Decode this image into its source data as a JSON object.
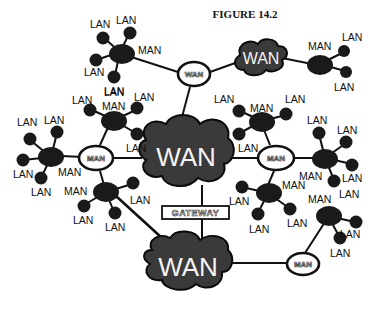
{
  "figure": {
    "title": "FIGURE 14.2"
  },
  "legend_terms": {
    "lan": "LAN",
    "man": "MAN",
    "wan": "WAN",
    "gateway": "GATEWAY"
  },
  "wan_clouds": [
    {
      "id": "wan-top-right",
      "label": "WAN"
    },
    {
      "id": "wan-center",
      "label": "WAN"
    },
    {
      "id": "wan-bottom",
      "label": "WAN"
    }
  ],
  "man_rings": [
    {
      "id": "ring-top",
      "label": "WAN"
    },
    {
      "id": "ring-left",
      "label": "MAN"
    },
    {
      "id": "ring-right",
      "label": "MAN"
    },
    {
      "id": "ring-bottom-right",
      "label": "MAN"
    }
  ],
  "gateway": {
    "label": "GATEWAY"
  },
  "man_clusters": [
    {
      "id": "cluster-top-left",
      "man_label": "MAN",
      "lan_labels": [
        "LAN",
        "LAN",
        "LAN",
        "LAN"
      ]
    },
    {
      "id": "cluster-top-right",
      "man_label": "MAN",
      "lan_labels": [
        "LAN",
        "LAN"
      ]
    },
    {
      "id": "cluster-mid-left-upper",
      "man_label": "MAN",
      "lan_labels": [
        "LAN",
        "LAN",
        "LAN",
        "LAN"
      ]
    },
    {
      "id": "cluster-far-left",
      "man_label": "MAN",
      "lan_labels": [
        "LAN",
        "LAN",
        "LAN",
        "LAN",
        "LAN"
      ]
    },
    {
      "id": "cluster-mid-left-lower",
      "man_label": "MAN",
      "lan_labels": [
        "LAN",
        "LAN",
        "LAN"
      ]
    },
    {
      "id": "cluster-mid-right-upper",
      "man_label": "MAN",
      "lan_labels": [
        "LAN",
        "LAN",
        "LAN"
      ]
    },
    {
      "id": "cluster-far-right",
      "man_label": "MAN",
      "lan_labels": [
        "LAN",
        "LAN",
        "LAN",
        "LAN"
      ]
    },
    {
      "id": "cluster-mid-right-lower",
      "man_label": "MAN",
      "lan_labels": [
        "LAN",
        "LAN",
        "LAN"
      ]
    },
    {
      "id": "cluster-bottom-right",
      "man_label": "MAN",
      "lan_labels": [
        "LAN",
        "LAN"
      ]
    }
  ],
  "colors": {
    "ink": "#111111",
    "cloud_fill": "#3a3a3a",
    "background": "#ffffff"
  }
}
